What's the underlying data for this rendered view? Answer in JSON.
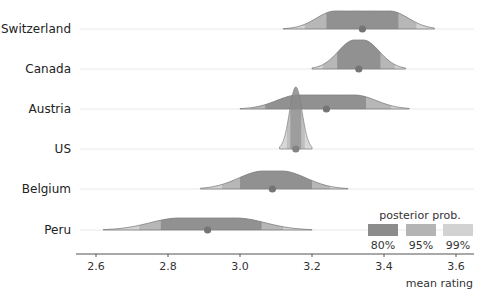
{
  "chart_data": {
    "type": "ridgeline",
    "title": "",
    "xlabel": "mean rating",
    "ylabel": "",
    "xlim": [
      2.55,
      3.65
    ],
    "x_ticks": [
      2.6,
      2.8,
      3.0,
      3.2,
      3.4,
      3.6
    ],
    "x_tick_labels": [
      "2.6",
      "2.8",
      "3.0",
      "3.2",
      "3.4",
      "3.6"
    ],
    "grid": "horizontal baselines",
    "categories": [
      "Switzerland",
      "Canada",
      "Austria",
      "US",
      "Belgium",
      "Peru"
    ],
    "series": [
      {
        "name": "Switzerland",
        "mean": 3.34,
        "range": [
          3.12,
          3.54
        ],
        "ci80": [
          3.24,
          3.44
        ],
        "ci95": [
          3.18,
          3.49
        ],
        "ci99": [
          3.12,
          3.54
        ],
        "peak_height": 18,
        "flat": 0.6
      },
      {
        "name": "Canada",
        "mean": 3.33,
        "range": [
          3.2,
          3.46
        ],
        "ci80": [
          3.27,
          3.39
        ],
        "ci95": [
          3.23,
          3.43
        ],
        "ci99": [
          3.2,
          3.46
        ],
        "peak_height": 29,
        "flat": 0.15
      },
      {
        "name": "Austria",
        "mean": 3.24,
        "range": [
          3.0,
          3.47
        ],
        "ci80": [
          3.07,
          3.35
        ],
        "ci95": [
          3.03,
          3.42
        ],
        "ci99": [
          3.0,
          3.47
        ],
        "peak_height": 14,
        "flat": 0.55
      },
      {
        "name": "US",
        "mean": 3.155,
        "range": [
          3.11,
          3.2
        ],
        "ci80": [
          3.14,
          3.17
        ],
        "ci95": [
          3.13,
          3.18
        ],
        "ci99": [
          3.11,
          3.2
        ],
        "peak_height": 62,
        "flat": 0.0
      },
      {
        "name": "Belgium",
        "mean": 3.09,
        "range": [
          2.89,
          3.3
        ],
        "ci80": [
          3.0,
          3.2
        ],
        "ci95": [
          2.95,
          3.25
        ],
        "ci99": [
          2.89,
          3.3
        ],
        "peak_height": 18,
        "flat": 0.2
      },
      {
        "name": "Peru",
        "mean": 2.91,
        "range": [
          2.62,
          3.2
        ],
        "ci80": [
          2.78,
          3.06
        ],
        "ci95": [
          2.72,
          3.12
        ],
        "ci99": [
          2.62,
          3.2
        ],
        "peak_height": 12,
        "flat": 0.45
      }
    ],
    "legend": {
      "title": "posterior prob.",
      "position": "bottom-right",
      "entries": [
        {
          "label": "80%",
          "color": "#8c8c8c"
        },
        {
          "label": "95%",
          "color": "#b4b4b4"
        },
        {
          "label": "99%",
          "color": "#d2d2d2"
        }
      ]
    },
    "colors": {
      "ci80": "#8c8c8c",
      "ci95": "#b4b4b4",
      "ci99": "#d2d2d2",
      "outline": "#7a7a7a",
      "point": "#6e6e6e",
      "baseline": "#e8e8e8",
      "axis": "#555555"
    }
  },
  "axis": {
    "xlabel": "mean rating"
  },
  "legend": {
    "title": "posterior prob.",
    "labels": [
      "80%",
      "95%",
      "99%"
    ]
  }
}
